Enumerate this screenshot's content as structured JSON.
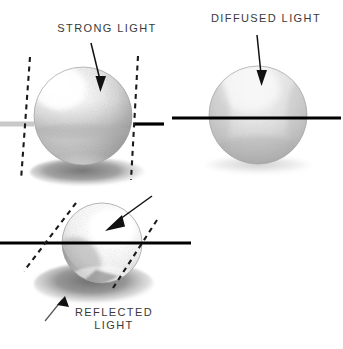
{
  "figure": {
    "background_color": "#ffffff",
    "width": 343,
    "height": 349,
    "medium": "pencil drawing"
  },
  "labels": {
    "strong_light": "STRONG LIGHT",
    "diffused_light": "DIFFUSED LIGHT",
    "reflected_light": "REFLECTED\nLIGHT"
  },
  "colors": {
    "text": "#3a3a3a",
    "horizon_black": "#000000",
    "horizon_gray": "#c9c9c9",
    "dash_line": "#1a1a1a",
    "arrow": "#111111",
    "sphere_light": "#ffffff",
    "sphere_mid": "#d8d8d8",
    "sphere_dark": "#9a9a9a",
    "shadow": "#8d8d8d"
  },
  "panels": [
    {
      "id": "strong-light",
      "label": "STRONG LIGHT",
      "sphere": {
        "cx": 83,
        "cy": 116,
        "r": 49
      },
      "light_direction": "upper-left, hard directional",
      "highlight": {
        "x": 62,
        "y": 92,
        "intensity": "bright specular"
      },
      "has_dashed_tangents": true,
      "has_cast_shadow": true,
      "cast_shadow": {
        "cx": 88,
        "cy": 172,
        "rx": 58,
        "ry": 14,
        "tone": "dark"
      },
      "horizon": {
        "left_segment": {
          "x1": 0,
          "x2": 33,
          "y": 124,
          "color": "#c9c9c9"
        },
        "right_segment": {
          "x1": 135,
          "x2": 164,
          "y": 124,
          "color": "#000000"
        }
      },
      "arrow": {
        "x1": 92,
        "y1": 44,
        "x2": 101,
        "y2": 86
      }
    },
    {
      "id": "diffused-light",
      "label": "DIFFUSED LIGHT",
      "sphere": {
        "cx": 258,
        "cy": 115,
        "r": 49
      },
      "light_direction": "overhead, soft / diffused",
      "highlight": {
        "x": 248,
        "y": 90,
        "intensity": "soft, broad"
      },
      "has_dashed_tangents": false,
      "has_cast_shadow": true,
      "cast_shadow": {
        "cx": 258,
        "cy": 166,
        "rx": 54,
        "ry": 9,
        "tone": "faint"
      },
      "horizon": {
        "full_segment": {
          "x1": 172,
          "x2": 341,
          "y": 118,
          "color": "#000000"
        }
      },
      "arrow": {
        "x1": 258,
        "y1": 36,
        "x2": 262,
        "y2": 80
      }
    },
    {
      "id": "reflected-light",
      "label": "REFLECTED\nLIGHT",
      "sphere": {
        "cx": 102,
        "cy": 243,
        "r": 40
      },
      "light_direction": "upper-right, with bounce light from below",
      "highlight": {
        "x": 110,
        "y": 228,
        "intensity": "very bright, fills form"
      },
      "has_dashed_tangents": true,
      "has_cast_shadow": true,
      "cast_shadow": {
        "cx": 96,
        "cy": 284,
        "rx": 58,
        "ry": 20,
        "tone": "dark, grainy"
      },
      "horizon": {
        "full_segment": {
          "x1": 0,
          "x2": 191,
          "y": 243,
          "color": "#000000"
        }
      },
      "arrow": {
        "x1": 151,
        "y1": 197,
        "x2": 107,
        "y2": 230
      },
      "callout_arrow": {
        "x1": 46,
        "y1": 320,
        "x2": 69,
        "y2": 292
      }
    }
  ]
}
